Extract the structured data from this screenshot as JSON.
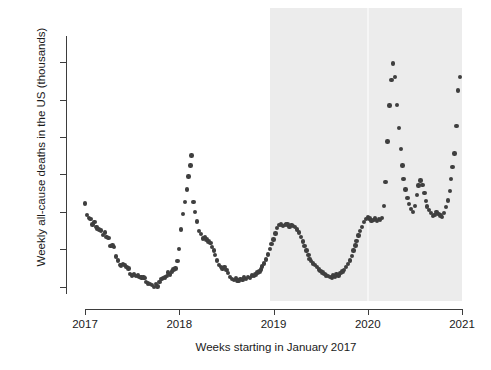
{
  "chart_data": {
    "type": "scatter",
    "title": "",
    "xlabel": "Weeks starting in January 2017",
    "ylabel": "Weekly all-cause deaths in the US (thousands)",
    "xlim": [
      2017.0,
      2021.0
    ],
    "ylim": [
      49.0,
      83.5
    ],
    "xticks": [
      "2017",
      "2018",
      "2019",
      "2020",
      "2021"
    ],
    "xtick_values": [
      2017,
      2018,
      2019,
      2020,
      2021
    ],
    "yticks": [
      "50",
      "55",
      "60",
      "65",
      "70",
      "75",
      "80"
    ],
    "ytick_values": [
      50,
      55,
      60,
      65,
      70,
      75,
      80
    ],
    "grid": false,
    "legend": null,
    "point_color": "#3f3f3f",
    "shaded_regions": [
      {
        "name": "highlight-2019-2021",
        "x_start": 2019.0,
        "x_end": 2021.0,
        "color": "#ececec"
      }
    ],
    "series": [
      {
        "name": "Weekly all-cause deaths",
        "x": [
          2017.0,
          2017.02,
          2017.04,
          2017.06,
          2017.08,
          2017.1,
          2017.12,
          2017.13,
          2017.15,
          2017.17,
          2017.19,
          2017.21,
          2017.23,
          2017.25,
          2017.27,
          2017.29,
          2017.31,
          2017.33,
          2017.35,
          2017.37,
          2017.38,
          2017.4,
          2017.42,
          2017.44,
          2017.46,
          2017.48,
          2017.5,
          2017.52,
          2017.54,
          2017.56,
          2017.58,
          2017.6,
          2017.62,
          2017.63,
          2017.65,
          2017.67,
          2017.69,
          2017.71,
          2017.73,
          2017.75,
          2017.77,
          2017.79,
          2017.81,
          2017.83,
          2017.85,
          2017.87,
          2017.88,
          2017.9,
          2017.92,
          2017.94,
          2017.96,
          2017.98,
          2018.0,
          2018.02,
          2018.04,
          2018.06,
          2018.08,
          2018.1,
          2018.12,
          2018.13,
          2018.15,
          2018.17,
          2018.19,
          2018.21,
          2018.23,
          2018.25,
          2018.27,
          2018.29,
          2018.31,
          2018.33,
          2018.35,
          2018.37,
          2018.38,
          2018.4,
          2018.42,
          2018.44,
          2018.46,
          2018.48,
          2018.5,
          2018.52,
          2018.54,
          2018.56,
          2018.58,
          2018.6,
          2018.62,
          2018.63,
          2018.65,
          2018.67,
          2018.69,
          2018.71,
          2018.73,
          2018.75,
          2018.77,
          2018.79,
          2018.81,
          2018.83,
          2018.85,
          2018.87,
          2018.88,
          2018.9,
          2018.92,
          2018.94,
          2018.96,
          2018.98,
          2019.0,
          2019.02,
          2019.04,
          2019.06,
          2019.08,
          2019.1,
          2019.12,
          2019.13,
          2019.15,
          2019.17,
          2019.19,
          2019.21,
          2019.23,
          2019.25,
          2019.27,
          2019.29,
          2019.31,
          2019.33,
          2019.35,
          2019.37,
          2019.38,
          2019.4,
          2019.42,
          2019.44,
          2019.46,
          2019.48,
          2019.5,
          2019.52,
          2019.54,
          2019.56,
          2019.58,
          2019.6,
          2019.62,
          2019.63,
          2019.65,
          2019.67,
          2019.69,
          2019.71,
          2019.73,
          2019.75,
          2019.77,
          2019.79,
          2019.81,
          2019.83,
          2019.85,
          2019.87,
          2019.88,
          2019.9,
          2019.92,
          2019.94,
          2019.96,
          2019.98,
          2020.0,
          2020.02,
          2020.04,
          2020.06,
          2020.08,
          2020.1,
          2020.12,
          2020.13,
          2020.15,
          2020.17,
          2020.19,
          2020.21,
          2020.23,
          2020.25,
          2020.27,
          2020.29,
          2020.31,
          2020.33,
          2020.35,
          2020.37,
          2020.38,
          2020.4,
          2020.42,
          2020.44,
          2020.46,
          2020.48,
          2020.5,
          2020.52,
          2020.54,
          2020.56,
          2020.58,
          2020.6,
          2020.62,
          2020.63,
          2020.65,
          2020.67,
          2020.69,
          2020.71,
          2020.73,
          2020.75,
          2020.77,
          2020.79,
          2020.81,
          2020.83,
          2020.85,
          2020.87,
          2020.88,
          2020.9,
          2020.92,
          2020.94,
          2020.96,
          2020.98
        ],
        "y": [
          61.1,
          59.6,
          59.2,
          59.0,
          58.3,
          58.6,
          58.0,
          57.7,
          57.6,
          57.5,
          56.9,
          57.2,
          56.6,
          56.5,
          55.4,
          55.5,
          55.3,
          54.0,
          53.5,
          52.9,
          52.8,
          53.0,
          52.9,
          52.6,
          52.4,
          51.7,
          51.5,
          51.6,
          51.4,
          51.5,
          51.3,
          51.2,
          51.2,
          51.1,
          50.6,
          50.4,
          50.3,
          50.2,
          49.9,
          50.3,
          50.0,
          50.6,
          51.0,
          51.1,
          51.2,
          51.4,
          51.9,
          51.6,
          52.0,
          52.3,
          52.4,
          53.4,
          55.0,
          57.6,
          59.7,
          61.3,
          63.0,
          64.7,
          66.2,
          67.5,
          61.3,
          60.0,
          58.7,
          57.4,
          57.0,
          56.4,
          56.6,
          56.3,
          56.0,
          55.8,
          55.3,
          54.8,
          54.2,
          53.5,
          52.9,
          52.6,
          52.4,
          52.6,
          52.2,
          51.8,
          51.3,
          51.0,
          50.9,
          51.1,
          50.8,
          50.7,
          51.0,
          50.9,
          51.2,
          51.0,
          51.3,
          51.1,
          51.5,
          51.4,
          51.6,
          51.9,
          52.0,
          52.3,
          52.7,
          53.1,
          53.6,
          54.3,
          55.0,
          55.7,
          56.3,
          57.1,
          57.8,
          58.2,
          58.3,
          58.1,
          58.2,
          58.4,
          58.3,
          58.0,
          58.2,
          58.1,
          58.0,
          57.6,
          57.2,
          56.6,
          56.0,
          55.4,
          54.8,
          54.2,
          53.7,
          53.4,
          53.1,
          52.9,
          52.6,
          52.3,
          52.1,
          51.9,
          51.7,
          51.5,
          51.4,
          51.3,
          51.2,
          51.5,
          51.3,
          51.6,
          51.5,
          51.8,
          52.0,
          52.2,
          52.6,
          53.0,
          53.5,
          54.1,
          54.8,
          55.5,
          56.1,
          56.8,
          57.4,
          58.0,
          58.6,
          59.0,
          59.3,
          59.1,
          58.8,
          58.9,
          59.1,
          58.8,
          59.0,
          58.9,
          59.2,
          60.8,
          64.0,
          69.4,
          74.2,
          77.6,
          79.8,
          78.0,
          74.3,
          71.2,
          68.4,
          66.2,
          64.4,
          63.0,
          61.8,
          61.0,
          60.4,
          60.0,
          60.8,
          62.2,
          63.5,
          64.2,
          63.6,
          62.5,
          61.4,
          60.7,
          60.2,
          59.8,
          59.4,
          59.6,
          60.0,
          59.7,
          59.5,
          59.3,
          59.8,
          60.6,
          61.5,
          62.8,
          64.4,
          66.0,
          67.8,
          71.5,
          76.2,
          78.0
        ]
      }
    ]
  },
  "axis": {
    "y_ticks": [
      "50",
      "55",
      "60",
      "65",
      "70",
      "75",
      "80"
    ],
    "x_ticks": [
      "2017",
      "2018",
      "2019",
      "2020",
      "2021"
    ],
    "y_title": "Weekly all-cause deaths in the US (thousands)",
    "x_title": "Weeks starting in January 2017"
  }
}
